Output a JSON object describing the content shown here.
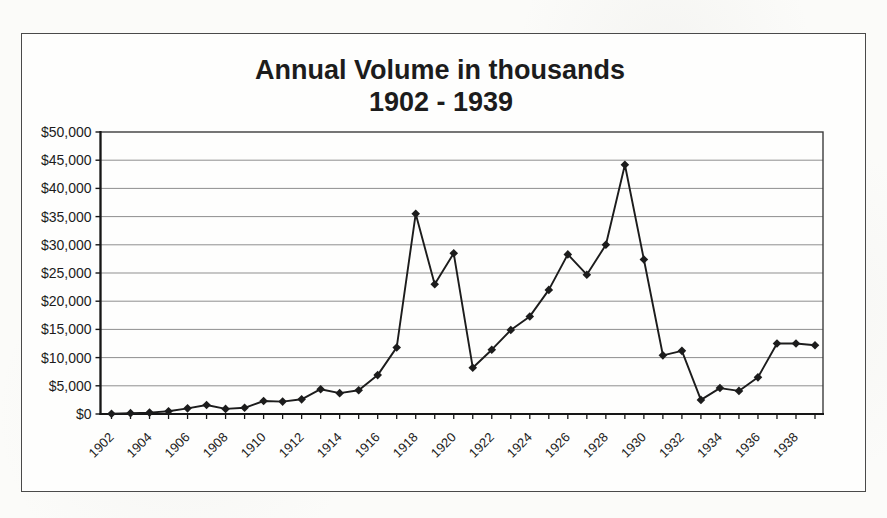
{
  "page": {
    "background_hex": "#fbfbf9"
  },
  "frame": {
    "border_hex": "#4a4a4a",
    "background_hex": "#fefefd"
  },
  "chart_data": {
    "type": "line",
    "title": "Annual Volume in thousands",
    "subtitle": "1902 - 1939",
    "legend": "none",
    "grid": "horizontal",
    "marker": "diamond",
    "xlabel": "",
    "ylabel": "",
    "ylim": [
      0,
      50000
    ],
    "ytick_step": 5000,
    "x_years": [
      1902,
      1903,
      1904,
      1905,
      1906,
      1907,
      1908,
      1909,
      1910,
      1911,
      1912,
      1913,
      1914,
      1915,
      1916,
      1917,
      1918,
      1919,
      1920,
      1921,
      1922,
      1923,
      1924,
      1925,
      1926,
      1927,
      1928,
      1929,
      1930,
      1931,
      1932,
      1933,
      1934,
      1935,
      1936,
      1937,
      1938,
      1939
    ],
    "values": [
      50,
      150,
      250,
      500,
      1000,
      1600,
      900,
      1100,
      2300,
      2200,
      2600,
      4400,
      3700,
      4200,
      6900,
      11800,
      35500,
      23000,
      28500,
      8200,
      11400,
      14900,
      17300,
      22000,
      28300,
      24700,
      30000,
      44200,
      27400,
      10400,
      11200,
      2500,
      4600,
      4100,
      6500,
      12500,
      12500,
      12200
    ],
    "ytick_labels": [
      "$0",
      "$5,000",
      "$10,000",
      "$15,000",
      "$20,000",
      "$25,000",
      "$30,000",
      "$35,000",
      "$40,000",
      "$45,000",
      "$50,000"
    ],
    "xtick_labels": [
      "1902",
      "1904",
      "1906",
      "1908",
      "1910",
      "1912",
      "1914",
      "1916",
      "1918",
      "1920",
      "1922",
      "1924",
      "1926",
      "1928",
      "1930",
      "1932",
      "1934",
      "1936",
      "1938"
    ],
    "ink_hex": "#1c1c1c",
    "grid_hex": "#8f8f8f",
    "axis_hex": "#161616",
    "frame_hex": "#3c3c3c"
  }
}
